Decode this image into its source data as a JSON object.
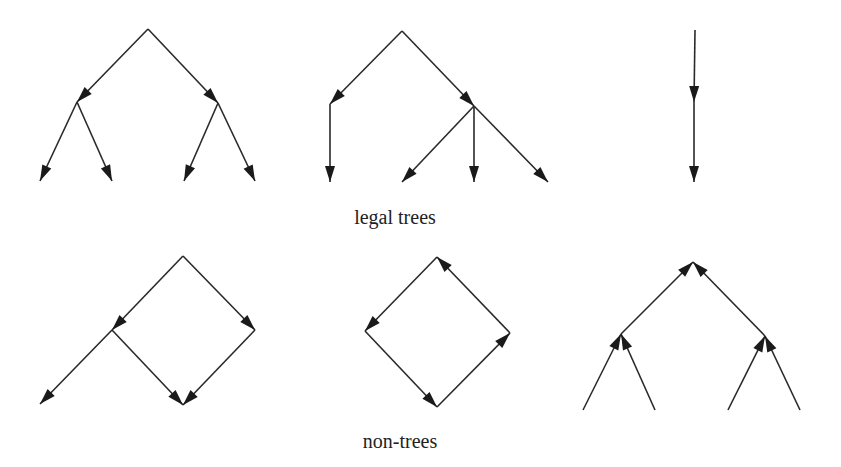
{
  "captions": {
    "legal": "legal trees",
    "non_trees": "non-trees"
  },
  "colors": {
    "line": "#2a2a2a",
    "arrowhead": "#1a1a1a",
    "background": "#ffffff",
    "text": "#222222"
  },
  "caption_positions": {
    "legal": {
      "x": 395,
      "y": 206
    },
    "non_trees": {
      "x": 400,
      "y": 430
    }
  },
  "graphs": [
    {
      "id": "legal-tree-binary",
      "group": "legal",
      "nodes": {
        "r": [
          148,
          29
        ],
        "a": [
          77,
          102
        ],
        "b": [
          218,
          103
        ],
        "c": [
          40,
          181
        ],
        "d": [
          112,
          181
        ],
        "e": [
          184,
          181
        ],
        "f": [
          255,
          181
        ]
      },
      "edges": [
        [
          "r",
          "a"
        ],
        [
          "r",
          "b"
        ],
        [
          "a",
          "c"
        ],
        [
          "a",
          "d"
        ],
        [
          "b",
          "e"
        ],
        [
          "b",
          "f"
        ]
      ]
    },
    {
      "id": "legal-tree-mixed",
      "group": "legal",
      "nodes": {
        "r": [
          402,
          31
        ],
        "a": [
          330,
          104
        ],
        "b": [
          474,
          106
        ],
        "c": [
          330,
          182
        ],
        "d": [
          402,
          182
        ],
        "e": [
          474,
          182
        ],
        "f": [
          548,
          182
        ]
      },
      "edges": [
        [
          "r",
          "a"
        ],
        [
          "r",
          "b"
        ],
        [
          "a",
          "c"
        ],
        [
          "b",
          "d"
        ],
        [
          "b",
          "e"
        ],
        [
          "b",
          "f"
        ]
      ]
    },
    {
      "id": "legal-tree-chain",
      "group": "legal",
      "nodes": {
        "r": [
          695,
          30
        ],
        "a": [
          694,
          102
        ],
        "b": [
          694,
          182
        ]
      },
      "edges": [
        [
          "r",
          "a"
        ],
        [
          "a",
          "b"
        ]
      ]
    },
    {
      "id": "non-tree-shared-child",
      "group": "non-trees",
      "nodes": {
        "r": [
          183,
          256
        ],
        "a": [
          112,
          330
        ],
        "b": [
          255,
          330
        ],
        "c": [
          40,
          404
        ],
        "d": [
          183,
          405
        ]
      },
      "edges": [
        [
          "r",
          "a"
        ],
        [
          "r",
          "b"
        ],
        [
          "a",
          "c"
        ],
        [
          "a",
          "d"
        ],
        [
          "b",
          "d"
        ]
      ]
    },
    {
      "id": "non-tree-cycle",
      "group": "non-trees",
      "nodes": {
        "t": [
          437,
          257
        ],
        "l": [
          365,
          331
        ],
        "rr": [
          510,
          333
        ],
        "bt": [
          437,
          407
        ]
      },
      "edges": [
        [
          "t",
          "l"
        ],
        [
          "l",
          "bt"
        ],
        [
          "bt",
          "rr"
        ],
        [
          "rr",
          "t"
        ]
      ]
    },
    {
      "id": "non-tree-inverted",
      "group": "non-trees",
      "nodes": {
        "t": [
          693,
          262
        ],
        "a": [
          621,
          334
        ],
        "b": [
          765,
          336
        ],
        "c": [
          583,
          410
        ],
        "d": [
          655,
          410
        ],
        "e": [
          728,
          410
        ],
        "f": [
          800,
          410
        ]
      },
      "edges": [
        [
          "a",
          "t"
        ],
        [
          "b",
          "t"
        ],
        [
          "c",
          "a"
        ],
        [
          "d",
          "a"
        ],
        [
          "e",
          "b"
        ],
        [
          "f",
          "b"
        ]
      ]
    }
  ]
}
